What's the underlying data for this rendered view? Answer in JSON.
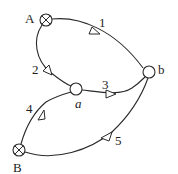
{
  "diagram": {
    "type": "directed-graph",
    "nodes": [
      {
        "id": "A",
        "label": "A",
        "symbol": "circle-cross",
        "kind": "source"
      },
      {
        "id": "B",
        "label": "B",
        "symbol": "circle-cross",
        "kind": "source"
      },
      {
        "id": "a",
        "label": "a",
        "symbol": "circle",
        "kind": "junction"
      },
      {
        "id": "b",
        "label": "b",
        "symbol": "circle",
        "kind": "junction"
      }
    ],
    "edges": [
      {
        "id": "1",
        "label": "1",
        "from": "A",
        "to": "b"
      },
      {
        "id": "2",
        "label": "2",
        "from": "A",
        "to": "a"
      },
      {
        "id": "3",
        "label": "3",
        "from": "a",
        "to": "b"
      },
      {
        "id": "4",
        "label": "4",
        "from": "B",
        "to": "a"
      },
      {
        "id": "5",
        "label": "5",
        "from": "B",
        "to": "b"
      }
    ]
  },
  "colors": {
    "stroke": "#2a2a2a",
    "background": "#ffffff"
  }
}
